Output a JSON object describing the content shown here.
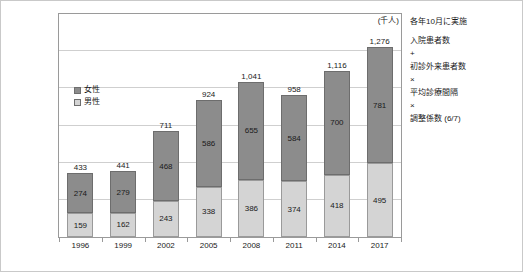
{
  "chart_data": {
    "type": "bar",
    "subtype": "stacked-vertical",
    "title": "",
    "xlabel": "",
    "ylabel": "",
    "unit_label": "(千人)",
    "categories": [
      "1996",
      "1999",
      "2002",
      "2005",
      "2008",
      "2011",
      "2014",
      "2017"
    ],
    "series": [
      {
        "name": "男性",
        "values": [
          159,
          162,
          243,
          338,
          386,
          374,
          418,
          495
        ],
        "color": "#d4d4d4",
        "stack_position": "bottom"
      },
      {
        "name": "女性",
        "values": [
          274,
          279,
          468,
          586,
          655,
          584,
          700,
          781
        ],
        "color": "#8c8c8c",
        "stack_position": "top"
      }
    ],
    "totals": [
      "433",
      "441",
      "711",
      "924",
      "1,041",
      "958",
      "1,116",
      "1,276"
    ],
    "totals_numeric": [
      433,
      441,
      711,
      924,
      1041,
      958,
      1116,
      1276
    ],
    "segment_labels": {
      "female": [
        "274",
        "279",
        "468",
        "586",
        "655",
        "584",
        "700",
        "781"
      ],
      "male": [
        "159",
        "162",
        "243",
        "338",
        "386",
        "374",
        "418",
        "495"
      ]
    },
    "ylim": [
      0,
      1500
    ],
    "ytick_interval": 250,
    "grid": true,
    "yaxis_ticks_visible": false,
    "legend_position": "inside-upper-left",
    "legend_entries": [
      "女性",
      "男性"
    ]
  },
  "legend": {
    "items": [
      {
        "label": "女性",
        "color": "#8c8c8c"
      },
      {
        "label": "男性",
        "color": "#d4d4d4"
      }
    ]
  },
  "annotation": {
    "lines": [
      {
        "text": "各年10月に実施",
        "kind": "note"
      },
      {
        "text": "",
        "kind": "gap"
      },
      {
        "text": "入院患者数",
        "kind": "term"
      },
      {
        "text": "+",
        "kind": "op"
      },
      {
        "text": "初診外来患者数",
        "kind": "term"
      },
      {
        "text": "×",
        "kind": "op"
      },
      {
        "text": "平均診療間隔",
        "kind": "term"
      },
      {
        "text": "×",
        "kind": "op"
      },
      {
        "text": "調整係数 (6/7)",
        "kind": "term"
      }
    ]
  },
  "colors": {
    "female": "#8c8c8c",
    "male": "#d4d4d4",
    "grid": "#cfcfcf",
    "frame": "#9a9a9a",
    "outer_border": "#c9c9c9",
    "text": "#1a1a1a",
    "background": "#ffffff"
  }
}
